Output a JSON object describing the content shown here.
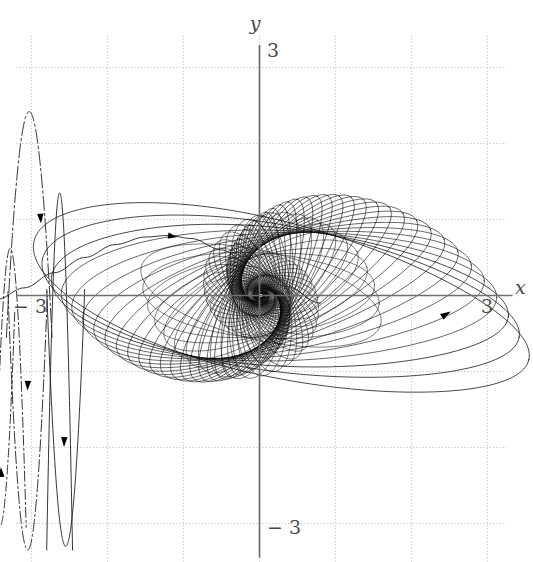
{
  "figure": {
    "kind": "phase-portrait",
    "background_color": "#ffffff",
    "width": 533,
    "height": 562
  },
  "axes": {
    "x_axis_label": "x",
    "y_axis_label": "y",
    "axis_color": "#6e6e6e",
    "grid_color": "#b5b5b5",
    "grid_style": "dotted",
    "x_ticks": [
      {
        "label": "− 3",
        "value": -3
      },
      {
        "label": "3",
        "value": 3
      }
    ],
    "y_ticks": [
      {
        "label": "3",
        "value": 3
      },
      {
        "label": "− 3",
        "value": -3
      }
    ],
    "xlim": [
      -3.6,
      3.6
    ],
    "ylim": [
      -3.6,
      3.6
    ],
    "grid_x_values": [
      -3,
      -2,
      -1,
      0,
      1,
      2,
      3
    ],
    "grid_y_values": [
      -3,
      -2,
      -1,
      0,
      1,
      2,
      3
    ]
  },
  "chart_data": {
    "type": "line",
    "title": "",
    "subtitle": "",
    "xlabel": "x",
    "ylabel": "y",
    "xlim": [
      -3.6,
      3.6
    ],
    "ylim": [
      -3.6,
      3.6
    ],
    "grid": true,
    "legend": "none",
    "curve_color": "#000000",
    "series": [
      {
        "name": "spiral-family",
        "kind": "nested-rotating-ellipses",
        "description": "Family of nested elliptical orbits rotating and contracting toward the origin, forming a dense dark core.",
        "count": 46,
        "semi_major_start": 3.25,
        "semi_minor_start": 1.02,
        "contraction_per_turn": 0.905,
        "rotation_step_deg": 4.35,
        "base_tilt_deg": -13.5,
        "center": [
          0.02,
          0.0
        ]
      },
      {
        "name": "hump-trajectory",
        "kind": "single-trajectory",
        "description": "Smooth arc rising from the left axis, peaking near (-1.2, 0.78) and descending into the dark core.",
        "points_x": [
          -3.45,
          -3.1,
          -2.7,
          -2.3,
          -1.9,
          -1.5,
          -1.2,
          -0.9,
          -0.5,
          -0.1,
          0.35,
          0.8
        ],
        "points_y": [
          -0.05,
          0.1,
          0.3,
          0.5,
          0.67,
          0.77,
          0.79,
          0.75,
          0.6,
          0.38,
          0.12,
          -0.1
        ],
        "arrow_at": [
          -1.15,
          0.78
        ]
      },
      {
        "name": "oscillation-left-upper",
        "kind": "oscillatory",
        "description": "Tall narrow oscillation above the x-axis on the far left, dash-dot styled, amplitude about 2.4.",
        "x_range": [
          -3.45,
          -2.45
        ],
        "amplitude": 2.42,
        "arrow_at": [
          -2.9,
          1.05
        ]
      },
      {
        "name": "oscillation-left-lower",
        "kind": "oscillatory",
        "description": "Narrow downward oscillation lobes below the x-axis on the far left.",
        "x_range": [
          -3.5,
          -2.45
        ],
        "amplitude": -2.6,
        "arrows_at": [
          [
            -3.05,
            -1.2
          ],
          [
            -2.6,
            -1.9
          ],
          [
            -3.42,
            -2.35
          ]
        ]
      },
      {
        "name": "spiral-inflow-arrow",
        "kind": "direction-marker",
        "description": "Arrowhead on the outermost orbit at the right, pointing up-right along the flow.",
        "position": [
          2.45,
          -0.25
        ]
      }
    ],
    "annotations": [
      {
        "text": "y",
        "position_px": [
          259,
          22
        ],
        "role": "y-axis-label"
      },
      {
        "text": "3",
        "position_px": [
          268,
          48
        ],
        "role": "y-tick-top"
      },
      {
        "text": "− 3",
        "position_px": [
          268,
          525
        ],
        "role": "y-tick-bottom"
      },
      {
        "text": "x",
        "position_px": [
          516,
          288
        ],
        "role": "x-axis-label"
      },
      {
        "text": "3",
        "position_px": [
          488,
          305
        ],
        "role": "x-tick-right"
      },
      {
        "text": "− 3",
        "position_px": [
          28,
          305
        ],
        "role": "x-tick-left"
      }
    ]
  }
}
